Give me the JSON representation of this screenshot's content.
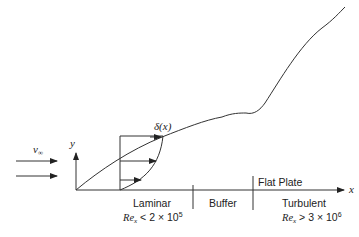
{
  "diagram": {
    "freestream_label": "v",
    "freestream_sub": "∞",
    "y_axis_label": "y",
    "x_axis_label": "x",
    "boundary_layer_label": "δ(x)",
    "plate_label": "Flat Plate",
    "regions": [
      {
        "name": "Laminar",
        "condition_prefix": "Re",
        "condition_sub": "x",
        "condition": " < 2 × 10",
        "exponent": "5"
      },
      {
        "name": "Buffer"
      },
      {
        "name": "Turbulent",
        "condition_prefix": "Re",
        "condition_sub": "x",
        "condition": " > 3 × 10",
        "exponent": "6"
      }
    ]
  },
  "colors": {
    "line": "#333333",
    "background": "#ffffff"
  }
}
